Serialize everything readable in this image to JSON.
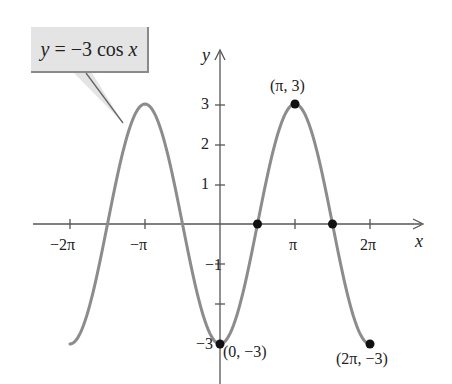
{
  "chart_data": {
    "type": "line",
    "title": "",
    "function": "y = -3 cos x",
    "annotation": "y = −3 cos x",
    "xlabel": "x",
    "ylabel": "y",
    "xlim": [
      -6.9,
      6.9
    ],
    "ylim": [
      -3.4,
      4.3
    ],
    "x_ticks": [
      {
        "value": -6.2832,
        "label": "−2π"
      },
      {
        "value": -3.1416,
        "label": "−π"
      },
      {
        "value": 3.1416,
        "label": "π"
      },
      {
        "value": 6.2832,
        "label": "2π"
      }
    ],
    "y_ticks": [
      {
        "value": 3,
        "label": "3"
      },
      {
        "value": 2,
        "label": "2"
      },
      {
        "value": 1,
        "label": "1"
      },
      {
        "value": -1,
        "label": "−1"
      },
      {
        "value": -2,
        "label": ""
      },
      {
        "value": -3,
        "label": "−3"
      }
    ],
    "series": [
      {
        "name": "y = -3cos x",
        "color": "#8c8c8c",
        "x_range": [
          -6.2832,
          6.2832
        ],
        "amplitude": -3
      }
    ],
    "marked_points": [
      {
        "x": 0,
        "y": -3,
        "label": "(0, −3)"
      },
      {
        "x": 1.5708,
        "y": 0,
        "label": ""
      },
      {
        "x": 3.1416,
        "y": 3,
        "label": "(π, 3)"
      },
      {
        "x": 4.7124,
        "y": 0,
        "label": ""
      },
      {
        "x": 6.2832,
        "y": -3,
        "label": "(2π, −3)"
      }
    ],
    "grid": false,
    "legend": "none"
  },
  "labels": {
    "callout_y": "y",
    "callout_mid": " = −3 cos ",
    "callout_x": "x",
    "axis_x": "x",
    "axis_y": "y",
    "tick_neg2pi": "−2π",
    "tick_negpi": "−π",
    "tick_pi": "π",
    "tick_2pi": "2π",
    "tick_y3": "3",
    "tick_y2": "2",
    "tick_y1": "1",
    "tick_yneg1": "−1",
    "tick_yneg3": "−3",
    "pt_max": "(π, 3)",
    "pt_origin_min": "(0, −3)",
    "pt_end_min": "(2π, −3)"
  },
  "colors": {
    "curve": "#8c8c8c",
    "axis": "#555555",
    "point": "#111111",
    "callout_fill": "#e4e4e4"
  }
}
